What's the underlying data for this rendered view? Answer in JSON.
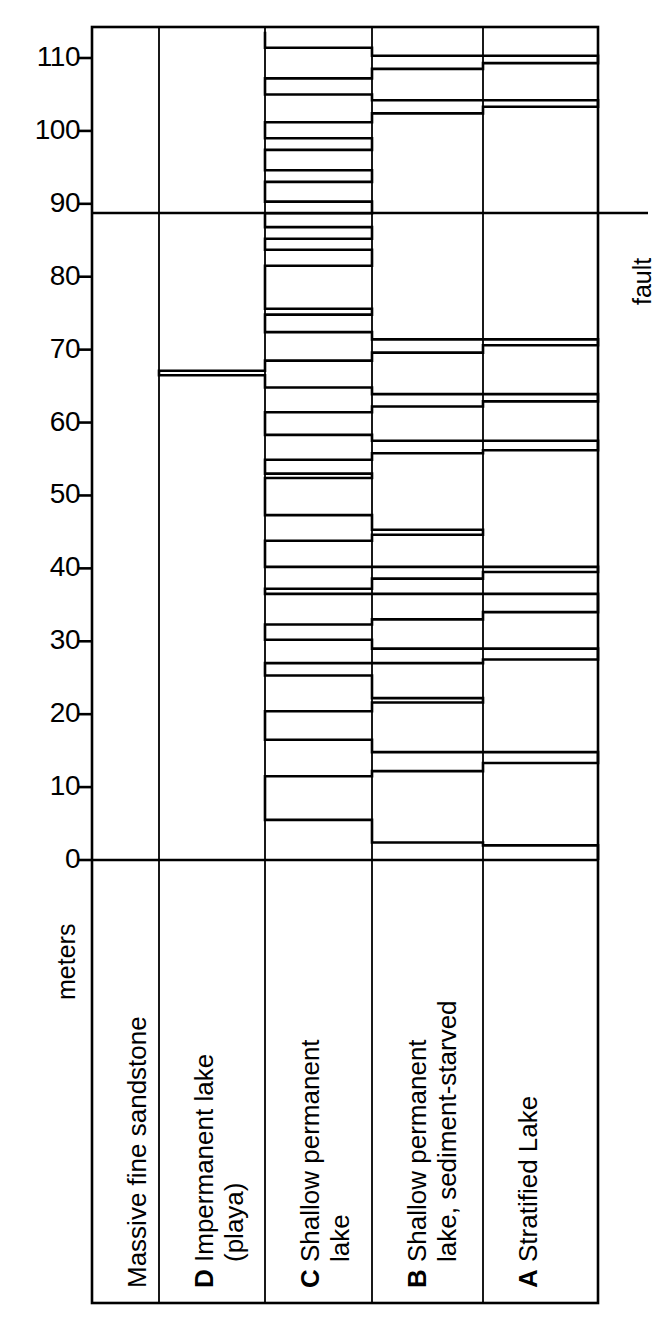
{
  "figure": {
    "axis_caption": "meters",
    "fault_label": "fault",
    "tick_labels": [
      "110",
      "100",
      "90",
      "80",
      "70",
      "60",
      "50",
      "40",
      "30",
      "20",
      "10",
      "0"
    ]
  },
  "columns": [
    {
      "code": "",
      "label": "Massive fine sandstone"
    },
    {
      "code": "D",
      "label": "Impermanent lake (playa)",
      "line1": "Impermanent lake",
      "line2": "(playa)"
    },
    {
      "code": "C",
      "label": "Shallow permanent lake",
      "line1": "Shallow permanent",
      "line2": "lake"
    },
    {
      "code": "B",
      "label": "Shallow permanent lake, sediment-starved",
      "line1": "Shallow permanent",
      "line2": "lake, sediment-starved"
    },
    {
      "code": "A",
      "label": "Stratified Lake",
      "line1": "Stratified Lake",
      "line2": ""
    }
  ],
  "chart_data": {
    "type": "line",
    "title": "",
    "xlabel": "",
    "ylabel": "meters",
    "ylim": [
      0,
      114
    ],
    "xlim": [
      0,
      5
    ],
    "grid": true,
    "legend_position": "none",
    "y_ticks": [
      0,
      10,
      20,
      30,
      40,
      50,
      60,
      70,
      80,
      90,
      100,
      110
    ],
    "x_categories": [
      "Massive fine sandstone",
      "D Impermanent lake (playa)",
      "C Shallow permanent lake",
      "B Shallow permanent lake, sediment-starved",
      "A Stratified Lake"
    ],
    "annotations": [
      {
        "text": "fault",
        "y": 88.7,
        "type": "horizontal-line"
      }
    ],
    "segments": [
      {
        "from": 0.0,
        "to": 0.4,
        "facies": 5
      },
      {
        "from": 0.4,
        "to": 2.0,
        "facies": 5
      },
      {
        "from": 2.0,
        "to": 2.4,
        "facies": 4
      },
      {
        "from": 2.4,
        "to": 5.5,
        "facies": 3
      },
      {
        "from": 5.5,
        "to": 11.5,
        "facies": 2
      },
      {
        "from": 11.5,
        "to": 12.2,
        "facies": 3
      },
      {
        "from": 12.2,
        "to": 13.3,
        "facies": 4
      },
      {
        "from": 13.3,
        "to": 14.8,
        "facies": 5
      },
      {
        "from": 14.8,
        "to": 16.5,
        "facies": 3
      },
      {
        "from": 16.5,
        "to": 20.4,
        "facies": 2
      },
      {
        "from": 20.4,
        "to": 21.6,
        "facies": 3
      },
      {
        "from": 21.6,
        "to": 22.2,
        "facies": 4
      },
      {
        "from": 22.2,
        "to": 25.3,
        "facies": 3
      },
      {
        "from": 25.3,
        "to": 27.0,
        "facies": 2
      },
      {
        "from": 27.0,
        "to": 27.5,
        "facies": 4
      },
      {
        "from": 27.5,
        "to": 29.0,
        "facies": 5
      },
      {
        "from": 29.0,
        "to": 30.2,
        "facies": 3
      },
      {
        "from": 30.2,
        "to": 32.3,
        "facies": 2
      },
      {
        "from": 32.3,
        "to": 33.0,
        "facies": 3
      },
      {
        "from": 33.0,
        "to": 34.0,
        "facies": 4
      },
      {
        "from": 34.0,
        "to": 36.5,
        "facies": 5
      },
      {
        "from": 36.5,
        "to": 37.2,
        "facies": 2
      },
      {
        "from": 37.2,
        "to": 38.6,
        "facies": 3
      },
      {
        "from": 38.6,
        "to": 39.5,
        "facies": 4
      },
      {
        "from": 39.5,
        "to": 40.2,
        "facies": 5
      },
      {
        "from": 40.2,
        "to": 43.8,
        "facies": 2
      },
      {
        "from": 43.8,
        "to": 44.6,
        "facies": 3
      },
      {
        "from": 44.6,
        "to": 45.3,
        "facies": 4
      },
      {
        "from": 45.3,
        "to": 47.3,
        "facies": 3
      },
      {
        "from": 47.3,
        "to": 52.4,
        "facies": 2
      },
      {
        "from": 52.4,
        "to": 53.0,
        "facies": 3
      },
      {
        "from": 53.0,
        "to": 54.9,
        "facies": 2
      },
      {
        "from": 54.9,
        "to": 55.8,
        "facies": 3
      },
      {
        "from": 55.8,
        "to": 56.2,
        "facies": 4
      },
      {
        "from": 56.2,
        "to": 57.5,
        "facies": 5
      },
      {
        "from": 57.5,
        "to": 58.3,
        "facies": 3
      },
      {
        "from": 58.3,
        "to": 61.4,
        "facies": 2
      },
      {
        "from": 61.4,
        "to": 62.2,
        "facies": 3
      },
      {
        "from": 62.2,
        "to": 62.9,
        "facies": 4
      },
      {
        "from": 62.9,
        "to": 63.9,
        "facies": 5
      },
      {
        "from": 63.9,
        "to": 64.8,
        "facies": 3
      },
      {
        "from": 64.8,
        "to": 66.5,
        "facies": 2
      },
      {
        "from": 66.5,
        "to": 67.1,
        "facies": 1
      },
      {
        "from": 67.1,
        "to": 68.5,
        "facies": 2
      },
      {
        "from": 68.5,
        "to": 69.6,
        "facies": 3
      },
      {
        "from": 69.6,
        "to": 70.6,
        "facies": 4
      },
      {
        "from": 70.6,
        "to": 71.4,
        "facies": 5
      },
      {
        "from": 71.4,
        "to": 72.4,
        "facies": 3
      },
      {
        "from": 72.4,
        "to": 74.8,
        "facies": 2
      },
      {
        "from": 74.8,
        "to": 75.6,
        "facies": 3
      },
      {
        "from": 75.6,
        "to": 81.5,
        "facies": 2
      },
      {
        "from": 81.5,
        "to": 83.7,
        "facies": 3
      },
      {
        "from": 83.7,
        "to": 85.2,
        "facies": 2
      },
      {
        "from": 85.2,
        "to": 86.8,
        "facies": 3
      },
      {
        "from": 86.8,
        "to": 88.7,
        "facies": 2
      },
      {
        "from": 88.7,
        "to": 90.3,
        "facies": 3
      },
      {
        "from": 90.3,
        "to": 93.0,
        "facies": 2
      },
      {
        "from": 93.0,
        "to": 94.6,
        "facies": 3
      },
      {
        "from": 94.6,
        "to": 97.4,
        "facies": 2
      },
      {
        "from": 97.4,
        "to": 99.0,
        "facies": 3
      },
      {
        "from": 99.0,
        "to": 101.2,
        "facies": 2
      },
      {
        "from": 101.2,
        "to": 102.4,
        "facies": 3
      },
      {
        "from": 102.4,
        "to": 103.3,
        "facies": 4
      },
      {
        "from": 103.3,
        "to": 104.2,
        "facies": 5
      },
      {
        "from": 104.2,
        "to": 105.0,
        "facies": 3
      },
      {
        "from": 105.0,
        "to": 107.2,
        "facies": 2
      },
      {
        "from": 107.2,
        "to": 108.5,
        "facies": 3
      },
      {
        "from": 108.5,
        "to": 109.3,
        "facies": 4
      },
      {
        "from": 109.3,
        "to": 110.3,
        "facies": 5
      },
      {
        "from": 110.3,
        "to": 111.4,
        "facies": 3
      },
      {
        "from": 111.4,
        "to": 113.6,
        "facies": 2
      }
    ]
  },
  "colors": {
    "stroke": "#000000",
    "background": "#ffffff",
    "grid": "#000000"
  }
}
